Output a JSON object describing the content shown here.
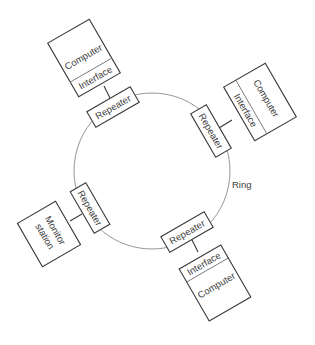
{
  "diagram": {
    "type": "ring-network",
    "ring_label": "Ring",
    "colors": {
      "stroke": "#3a3a3a",
      "ring": "#8a8a8a",
      "background": "#ffffff"
    },
    "nodes": [
      {
        "id": "top-left",
        "repeater": "Repeater",
        "interface": "Interface",
        "device": "Computer"
      },
      {
        "id": "right",
        "repeater": "Repeater",
        "interface": "Interface",
        "device": "Computer"
      },
      {
        "id": "bottom",
        "repeater": "Repeater",
        "interface": "Interface",
        "device": "Computer"
      },
      {
        "id": "left",
        "repeater": "Repeater",
        "device_line1": "Monitor",
        "device_line2": "station"
      }
    ]
  }
}
